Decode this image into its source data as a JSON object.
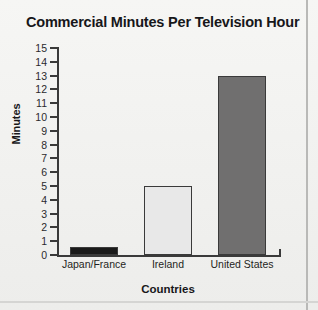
{
  "chart_data": {
    "type": "bar",
    "title": "Commercial Minutes Per Television Hour",
    "xlabel": "Countries",
    "ylabel": "Minutes",
    "categories": [
      "Japan/France",
      "Ireland",
      "United States"
    ],
    "values": [
      0.6,
      5,
      13
    ],
    "ylim": [
      0,
      15
    ],
    "ytick_step": 1,
    "yticks": [
      "15",
      "14",
      "13",
      "12",
      "11",
      "10",
      "9",
      "8",
      "7",
      "6",
      "5",
      "4",
      "3",
      "2",
      "1",
      "0"
    ],
    "grid": false,
    "legend": "none",
    "bar_colors": [
      "#1a1a1a",
      "#e8e8e8",
      "#706f6f"
    ],
    "bar_edge_color": "#3a3a3a"
  },
  "figure": {
    "background_color": "#f2f2f0",
    "axis_color": "#3a3a3a",
    "text_color": "#17171a"
  }
}
